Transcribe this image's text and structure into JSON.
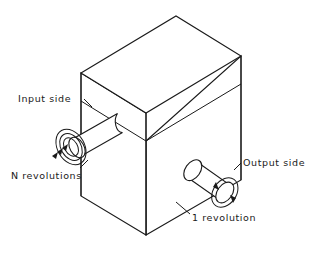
{
  "diagram": {
    "colors": {
      "stroke": "#1a1a1a",
      "face_fill": "#ffffff",
      "background": "#ffffff"
    },
    "labels": {
      "input_side": "Input side",
      "n_revolutions": "N revolutions",
      "output_side": "Output side",
      "one_revolution": "1 revolution"
    },
    "parts": {
      "housing": "gearbox-housing",
      "lid_seam": "housing-lid-seam",
      "input_shaft": "input-shaft",
      "output_shaft": "output-shaft",
      "input_rotation_arrow": "multi-turn-spiral-arrow",
      "output_rotation_arrow": "single-turn-circular-arrow"
    },
    "rotation": {
      "input_turns": "N",
      "output_turns": "1"
    }
  }
}
